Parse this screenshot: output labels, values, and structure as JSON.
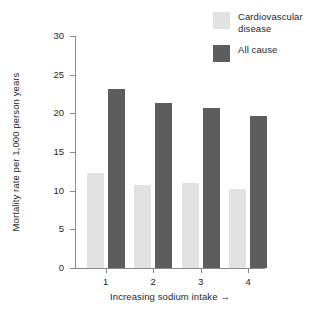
{
  "chart_data": {
    "type": "bar",
    "title": "",
    "subtitle": "",
    "xlabel": "Increasing sodium intake →",
    "ylabel": "Mortality rate per 1,000 person years",
    "categories": [
      "1",
      "2",
      "3",
      "4"
    ],
    "series": [
      {
        "name": "Cardiovascular disease",
        "color": "#e2e2e2",
        "values": [
          12.3,
          10.7,
          11.0,
          10.2
        ]
      },
      {
        "name": "All cause",
        "color": "#5d5d5d",
        "values": [
          23.2,
          21.3,
          20.7,
          19.7
        ]
      }
    ],
    "ylim": [
      0,
      30
    ],
    "yticks": [
      0,
      5,
      10,
      15,
      20,
      25,
      30
    ],
    "ytick_labels": [
      "0",
      "5",
      "10",
      "15",
      "20",
      "25",
      "30"
    ],
    "grid": false,
    "legend_position": "top-right",
    "axis_color": "#8a8a8a"
  },
  "legend": {
    "items": [
      {
        "label": "Cardiovascular disease",
        "color": "#e2e2e2"
      },
      {
        "label": "All cause",
        "color": "#5d5d5d"
      }
    ]
  }
}
